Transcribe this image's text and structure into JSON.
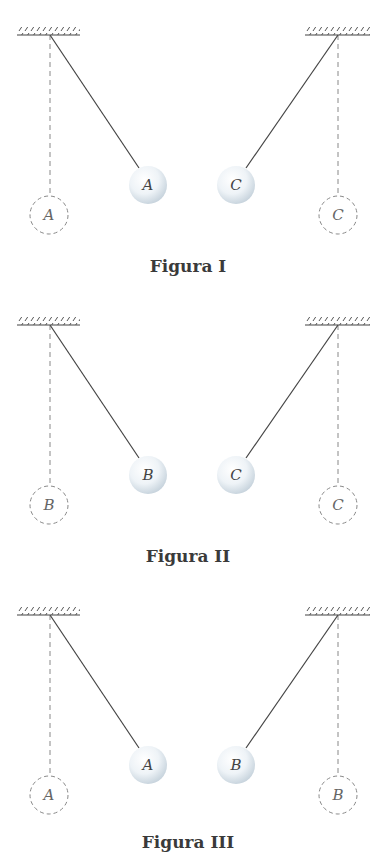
{
  "page": {
    "top_cut_text": "",
    "colors": {
      "line": "#444444",
      "dashed": "#888888",
      "ball_fill": "#eef3f7",
      "ball_shadow": "#c7d3dd",
      "label": "#3a3a3a"
    }
  },
  "figures": [
    {
      "label": "Figura I",
      "left_ball": {
        "letter": "A",
        "ghost_letter": "A"
      },
      "right_ball": {
        "letter": "C",
        "ghost_letter": "C"
      }
    },
    {
      "label": "Figura II",
      "left_ball": {
        "letter": "B",
        "ghost_letter": "B"
      },
      "right_ball": {
        "letter": "C",
        "ghost_letter": "C"
      }
    },
    {
      "label": "Figura III",
      "left_ball": {
        "letter": "A",
        "ghost_letter": "A"
      },
      "right_ball": {
        "letter": "B",
        "ghost_letter": "B"
      }
    }
  ]
}
